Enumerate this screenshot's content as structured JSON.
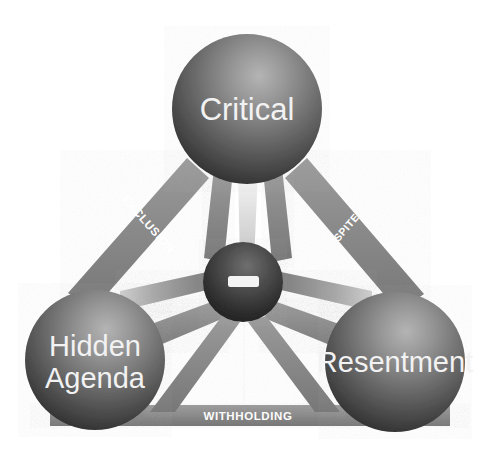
{
  "diagram": {
    "background_color": "#ffffff",
    "nodes": [
      {
        "id": "critical",
        "label": "Critical",
        "position": "top",
        "cx": 247,
        "cy": 109,
        "r": 75,
        "fill_light": "#9a9a9a",
        "fill_dark": "#343434",
        "text_color": "#f2f2f2"
      },
      {
        "id": "hidden-agenda",
        "label": "Hidden\nAgenda",
        "label_line1": "Hidden",
        "label_line2": "Agenda",
        "position": "bottom-left",
        "cx": 95,
        "cy": 360,
        "r": 70,
        "fill_light": "#9a9a9a",
        "fill_dark": "#343434",
        "text_color": "#f2f2f2"
      },
      {
        "id": "resentment",
        "label": "Resentment",
        "position": "bottom-right",
        "cx": 395,
        "cy": 362,
        "r": 70,
        "fill_light": "#9a9a9a",
        "fill_dark": "#343434",
        "text_color": "#f2f2f2"
      },
      {
        "id": "center-hub",
        "label": "",
        "position": "center",
        "cx": 243,
        "cy": 282,
        "r": 40,
        "fill_light": "#6d6d6d",
        "fill_dark": "#262626",
        "marker": "dash"
      }
    ],
    "edges": [
      {
        "id": "exclusion",
        "label": "EXCLUSION",
        "from": "critical",
        "to": "hidden-agenda",
        "side": "left",
        "rotation_deg": 58,
        "color": "#8c8c8c"
      },
      {
        "id": "spite",
        "label": "SPITE",
        "from": "critical",
        "to": "resentment",
        "side": "right",
        "rotation_deg": -58,
        "color": "#8c8c8c"
      },
      {
        "id": "withholding",
        "label": "WITHHOLDING",
        "from": "hidden-agenda",
        "to": "resentment",
        "side": "bottom",
        "rotation_deg": 0,
        "color": "#8c8c8c"
      }
    ],
    "spokes": [
      {
        "id": "spoke-critical-left",
        "from": "critical",
        "to": "center-hub",
        "color": "#8c8c8c"
      },
      {
        "id": "spoke-critical-right",
        "from": "critical",
        "to": "center-hub",
        "color": "#8c8c8c"
      },
      {
        "id": "spoke-critical-mid",
        "from": "critical",
        "to": "center-hub",
        "color": "#d8d8d8"
      },
      {
        "id": "spoke-hidden-upper",
        "from": "hidden-agenda",
        "to": "center-hub",
        "color": "#8c8c8c"
      },
      {
        "id": "spoke-hidden-lower",
        "from": "hidden-agenda",
        "to": "center-hub",
        "color": "#8c8c8c"
      },
      {
        "id": "spoke-resent-upper",
        "from": "resentment",
        "to": "center-hub",
        "color": "#8c8c8c"
      },
      {
        "id": "spoke-resent-lower",
        "from": "resentment",
        "to": "center-hub",
        "color": "#8c8c8c"
      }
    ],
    "colors": {
      "beam": "#8c8c8c",
      "beam_light": "#d8d8d8",
      "sphere_highlight": "#a8a8a8",
      "sphere_shadow": "#2b2b2b",
      "hub_highlight": "#707070",
      "hub_shadow": "#1f1f1f",
      "label_text": "#ffffff",
      "node_text": "#f2f2f2",
      "background": "#ffffff"
    }
  }
}
